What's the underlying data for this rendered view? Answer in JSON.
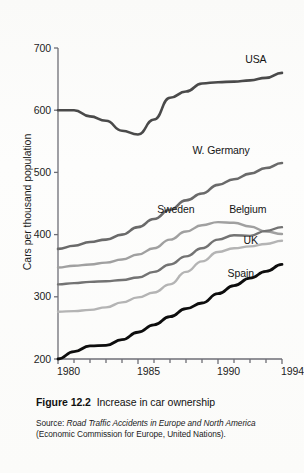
{
  "figure": {
    "number": "Figure 12.2",
    "title": "Increase in car ownership",
    "source_label": "Source:",
    "source_title": "Road Traffic Accidents in Europe and North America",
    "source_note": "(Economic Commission for Europe, United Nations)."
  },
  "chart_data": {
    "type": "line",
    "title": "Increase in car ownership",
    "xlabel": "",
    "ylabel": "Cars per thousand population",
    "xlim": [
      1980,
      1994
    ],
    "ylim": [
      200,
      700
    ],
    "ytick_labels": [
      "200",
      "300",
      "400",
      "500",
      "600",
      "700"
    ],
    "yticks": [
      200,
      300,
      400,
      500,
      600,
      700
    ],
    "xtick_labels": [
      "1980",
      "1985",
      "1990",
      "1994"
    ],
    "xticks_major": [
      1980,
      1985,
      1990,
      1994
    ],
    "xticks_minor": [
      1980,
      1981,
      1982,
      1983,
      1984,
      1985,
      1986,
      1987,
      1988,
      1989,
      1990,
      1991,
      1992,
      1993,
      1994
    ],
    "grid": false,
    "legend": "inline-labels",
    "x": [
      1980,
      1981,
      1982,
      1983,
      1984,
      1985,
      1986,
      1987,
      1988,
      1989,
      1990,
      1991,
      1992,
      1993,
      1994
    ],
    "series": [
      {
        "name": "USA",
        "color": "#4a4a4a",
        "width": 2.6,
        "values": [
          600,
          600,
          590,
          583,
          567,
          561,
          585,
          620,
          630,
          643,
          645,
          646,
          648,
          652,
          660
        ],
        "label_x": 1991.7,
        "label_y": 682
      },
      {
        "name": "W. Germany",
        "color": "#6a6a6a",
        "width": 2.6,
        "values": [
          377,
          382,
          388,
          392,
          400,
          412,
          425,
          440,
          455,
          466,
          480,
          489,
          498,
          507,
          515
        ],
        "label_x": 1988.4,
        "label_y": 536
      },
      {
        "name": "Sweden",
        "color": "#a0a0a0",
        "width": 2.4,
        "values": [
          347,
          350,
          352,
          355,
          360,
          368,
          378,
          392,
          405,
          415,
          420,
          419,
          413,
          405,
          401
        ],
        "label_x": 1986.2,
        "label_y": 441
      },
      {
        "name": "Belgium",
        "color": "#737373",
        "width": 2.4,
        "values": [
          320,
          322,
          324,
          325,
          327,
          331,
          340,
          352,
          365,
          378,
          392,
          399,
          398,
          406,
          412
        ],
        "label_x": 1990.7,
        "label_y": 440
      },
      {
        "name": "UK",
        "color": "#b4b4b4",
        "width": 2.4,
        "values": [
          276,
          277,
          279,
          283,
          291,
          299,
          307,
          320,
          340,
          357,
          372,
          378,
          381,
          385,
          390
        ],
        "label_x": 1991.6,
        "label_y": 391
      },
      {
        "name": "Spain",
        "color": "#0d0d0d",
        "width": 2.8,
        "values": [
          200,
          212,
          221,
          222,
          231,
          243,
          255,
          268,
          281,
          290,
          305,
          318,
          330,
          341,
          352
        ],
        "label_x": 1990.6,
        "label_y": 337
      }
    ]
  },
  "axis": {
    "axis_color": "#6e6e76",
    "tick_color": "#6e6e76"
  }
}
